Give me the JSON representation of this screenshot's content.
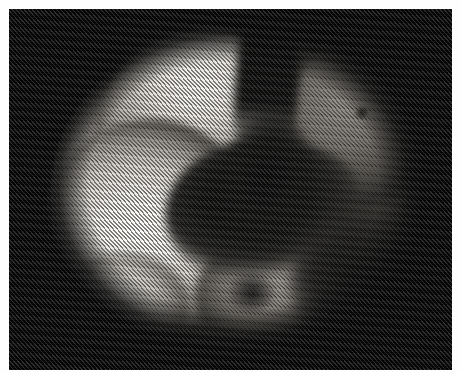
{
  "image": {
    "kind": "halftone-photograph-scan",
    "subject": "lobed spherical specimen",
    "background_color": "#020202",
    "border_color": "#fdfdfd",
    "width": 462,
    "height": 373,
    "caption": "",
    "alt_text": "Grayscale halftone photograph of a roughly spherical lobed object lit from the left, set against a black field",
    "halftone": {
      "pattern": "diagonal line screen",
      "angle_degrees": 48,
      "line_spacing_px": 3
    },
    "plate": {
      "left": 9,
      "top": 9,
      "width": 443,
      "height": 361
    },
    "regions": [
      {
        "name": "bright-left-lobe",
        "tone": "highlight",
        "color": "#fdfcfa"
      },
      {
        "name": "bright-upper-cap",
        "tone": "highlight",
        "color": "#f6f4f0"
      },
      {
        "name": "lower-left-notch",
        "tone": "light",
        "color": "#efece7"
      },
      {
        "name": "central-dark-furrow",
        "tone": "shadow",
        "color": "#050505"
      },
      {
        "name": "top-center-cleft",
        "tone": "shadow",
        "color": "#050505"
      },
      {
        "name": "upper-right-band",
        "tone": "midtone",
        "color": "#96918a"
      },
      {
        "name": "lower-center-lobe",
        "tone": "midtone",
        "color": "#a8a39c"
      },
      {
        "name": "lower-right-shadow",
        "tone": "shadow",
        "color": "#0a0a09"
      },
      {
        "name": "dark-speck",
        "tone": "shadow",
        "color": "#060606"
      }
    ]
  }
}
